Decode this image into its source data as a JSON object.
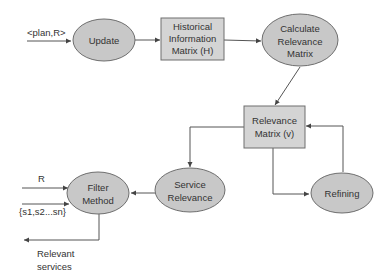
{
  "diagram": {
    "nodes": {
      "update": {
        "shape": "ellipse",
        "lines": [
          "Update"
        ]
      },
      "historical": {
        "shape": "rect",
        "lines": [
          "Historical",
          "Information",
          "Matrix (H)"
        ]
      },
      "calculate": {
        "shape": "ellipse",
        "lines": [
          "Calculate",
          "Relevance",
          "Matrix"
        ]
      },
      "relevance_matrix": {
        "shape": "rect",
        "lines": [
          "Relevance",
          "Matrix (v)"
        ]
      },
      "service_relevance": {
        "shape": "ellipse",
        "lines": [
          "Service",
          "Relevance"
        ]
      },
      "refining": {
        "shape": "ellipse",
        "lines": [
          "Refining"
        ]
      },
      "filter": {
        "shape": "ellipse",
        "lines": [
          "Filter",
          "Method"
        ]
      }
    },
    "labels": {
      "input_plan": "<plan,R>",
      "input_r": "R",
      "input_services": "{s1,s2...sn}",
      "output_line1": "Relevant",
      "output_line2": "services"
    },
    "edges": [
      {
        "from": "input_plan",
        "to": "update"
      },
      {
        "from": "update",
        "to": "historical"
      },
      {
        "from": "historical",
        "to": "calculate"
      },
      {
        "from": "calculate",
        "to": "relevance_matrix"
      },
      {
        "from": "relevance_matrix",
        "to": "service_relevance"
      },
      {
        "from": "relevance_matrix",
        "to": "refining"
      },
      {
        "from": "refining",
        "to": "relevance_matrix"
      },
      {
        "from": "service_relevance",
        "to": "filter"
      },
      {
        "from": "input_r",
        "to": "filter"
      },
      {
        "from": "input_services",
        "to": "filter"
      },
      {
        "from": "filter",
        "to": "output"
      }
    ],
    "colors": {
      "node_fill": "#c8c8c8",
      "box_fill": "#d4d4d4",
      "stroke": "#6e6e6e",
      "text": "#333333"
    }
  }
}
